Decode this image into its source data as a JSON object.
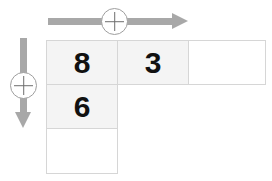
{
  "puzzle": {
    "type": "addition-grid",
    "colors": {
      "arrow": "#a8a8a8",
      "badge_stroke": "#9e9e9e",
      "plus_stroke": "#6e6e6e",
      "cell_border": "#d6d6d6",
      "cell_filled": "#f4f4f4",
      "cell_empty": "#ffffff",
      "digit": "#111111"
    },
    "operators": {
      "horizontal": {
        "symbol": "+",
        "icon": "plus-circle-icon",
        "direction": "right",
        "arrow_icon": "arrow-right-icon"
      },
      "vertical": {
        "symbol": "+",
        "icon": "plus-circle-icon",
        "direction": "down",
        "arrow_icon": "arrow-down-icon"
      }
    },
    "grid": {
      "top_row": [
        {
          "value": "8",
          "state": "filled"
        },
        {
          "value": "3",
          "state": "filled"
        },
        {
          "value": "",
          "state": "empty"
        }
      ],
      "left_column_below": [
        {
          "value": "6",
          "state": "filled"
        },
        {
          "value": "",
          "state": "empty"
        }
      ]
    }
  }
}
